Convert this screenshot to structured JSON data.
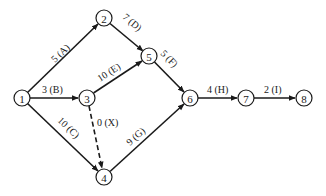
{
  "diagram": {
    "type": "activity-on-arrow network",
    "colors": {
      "line": "#1a1a1a",
      "background": "#ffffff"
    },
    "nodes": [
      {
        "id": "1",
        "label": "1",
        "x": 22,
        "y": 98
      },
      {
        "id": "2",
        "label": "2",
        "x": 104,
        "y": 18
      },
      {
        "id": "3",
        "label": "3",
        "x": 87,
        "y": 98
      },
      {
        "id": "4",
        "label": "4",
        "x": 104,
        "y": 177
      },
      {
        "id": "5",
        "label": "5",
        "x": 149,
        "y": 56
      },
      {
        "id": "6",
        "label": "6",
        "x": 190,
        "y": 98
      },
      {
        "id": "7",
        "label": "7",
        "x": 246,
        "y": 98
      },
      {
        "id": "8",
        "label": "8",
        "x": 304,
        "y": 98
      }
    ],
    "edges": [
      {
        "from": "1",
        "to": "2",
        "label": "5 (A)",
        "activity": "A",
        "duration": 5,
        "dashed": false
      },
      {
        "from": "1",
        "to": "3",
        "label": "3 (B)",
        "activity": "B",
        "duration": 3,
        "dashed": false
      },
      {
        "from": "1",
        "to": "4",
        "label": "10 (C)",
        "activity": "C",
        "duration": 10,
        "dashed": false
      },
      {
        "from": "2",
        "to": "5",
        "label": "7 (D)",
        "activity": "D",
        "duration": 7,
        "dashed": false
      },
      {
        "from": "3",
        "to": "5",
        "label": "10 (E)",
        "activity": "E",
        "duration": 10,
        "dashed": false
      },
      {
        "from": "3",
        "to": "4",
        "label": "0 (X)",
        "activity": "X",
        "duration": 0,
        "dashed": true
      },
      {
        "from": "5",
        "to": "6",
        "label": "5 (F)",
        "activity": "F",
        "duration": 5,
        "dashed": false
      },
      {
        "from": "4",
        "to": "6",
        "label": "9 (G)",
        "activity": "G",
        "duration": 9,
        "dashed": false
      },
      {
        "from": "6",
        "to": "7",
        "label": "4 (H)",
        "activity": "H",
        "duration": 4,
        "dashed": false
      },
      {
        "from": "7",
        "to": "8",
        "label": "2 (I)",
        "activity": "I",
        "duration": 2,
        "dashed": false
      }
    ]
  }
}
